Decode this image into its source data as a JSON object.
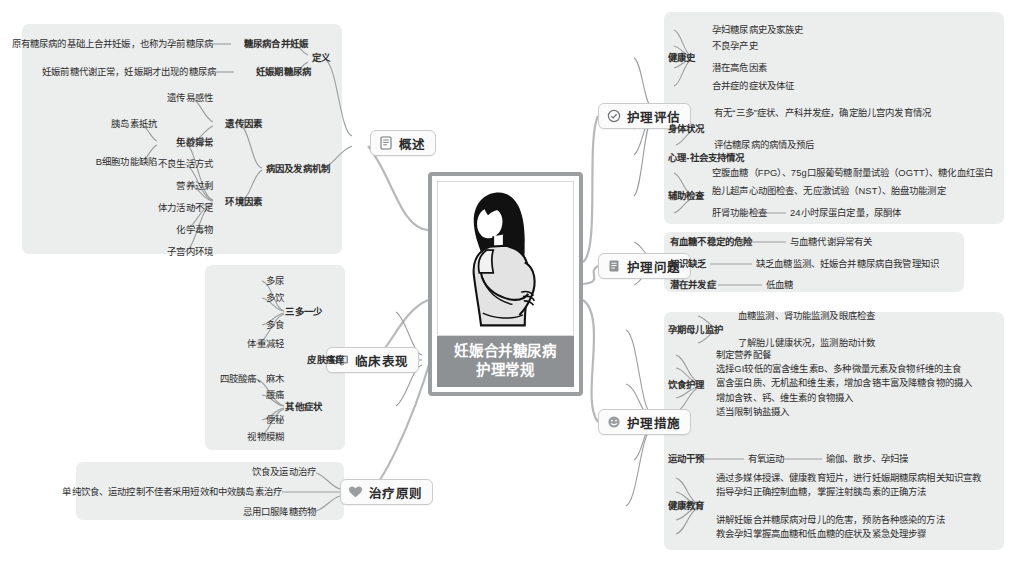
{
  "center": {
    "title_line1": "妊娠合并糖尿病",
    "title_line2": "护理常规",
    "illustration": "pregnant-woman-illustration",
    "frame_color": "#9c9fa2",
    "caption_bg": "#8e9194"
  },
  "branches": [
    {
      "id": "overview",
      "label": "概述",
      "icon": "book-icon"
    },
    {
      "id": "clinical",
      "label": "临床表现",
      "icon": "monitor-icon"
    },
    {
      "id": "treatment",
      "label": "治疗原则",
      "icon": "heart-icon"
    },
    {
      "id": "assessment",
      "label": "护理评估",
      "icon": "check-circle-icon"
    },
    {
      "id": "problems",
      "label": "护理问题",
      "icon": "list-icon"
    },
    {
      "id": "measures",
      "label": "护理措施",
      "icon": "smiley-icon"
    }
  ],
  "overview": {
    "definition": {
      "label": "定义",
      "items": [
        {
          "label": "糖尿病合并妊娠",
          "detail": "原有糖尿病的基础上合并妊娠，也称为孕前糖尿病"
        },
        {
          "label": "妊娠期糖尿病",
          "detail": "妊娠前糖代谢正常，妊娠期才出现的糖尿病"
        }
      ]
    },
    "etiology": {
      "label": "病因及发病机制",
      "genetic": {
        "label": "遗传因素",
        "items": [
          "遗传易感性",
          "免疫异常"
        ],
        "immune_children": [
          "胰岛素抵抗",
          "B细胞功能缺陷"
        ]
      },
      "environment": {
        "label": "环境因素",
        "items": [
          "年龄增长",
          "不良生活方式",
          "营养过剩",
          "体力活动不足",
          "化学毒物",
          "子宫内环境"
        ]
      }
    }
  },
  "clinical": {
    "groups": [
      {
        "label": "三多一少",
        "items": [
          "多尿",
          "多饮",
          "多食",
          "体重减轻"
        ]
      },
      {
        "label": "皮肤瘙痒",
        "items": []
      },
      {
        "label": "其他症状",
        "items": [
          "四肢酸痛、麻木",
          "腰痛",
          "便秘",
          "视物模糊"
        ]
      }
    ]
  },
  "treatment": {
    "items": [
      "饮食及运动治疗",
      "单纯饮食、运动控制不佳者采用短效和中效胰岛素治疗",
      "忌用口服降糖药物"
    ]
  },
  "assessment": {
    "groups": [
      {
        "label": "健康史",
        "items": [
          "孕妇糖尿病史及家族史",
          "不良孕产史",
          "潜在高危因素",
          "合并症的症状及体征"
        ]
      },
      {
        "label": "身体状况",
        "items": [
          "有无“三多”症状、产科并发症，确定胎儿宫内发育情况",
          "评估糖尿病的病情及预后"
        ]
      },
      {
        "label": "心理-社会支持情况",
        "items": []
      },
      {
        "label": "辅助检查",
        "items": [
          "空腹血糖（FPG）、75g口服葡萄糖耐量试验（OGTT）、糖化血红蛋白",
          "胎儿超声心动图检查、无应激试验（NST）、胎盘功能测定",
          "肝肾功能检查"
        ],
        "sub": {
          "parent": "肝肾功能检查",
          "detail": "24小时尿蛋白定量，尿酮体"
        }
      }
    ]
  },
  "problems": {
    "items": [
      {
        "label": "有血糖不稳定的危险",
        "detail": "与血糖代谢异常有关"
      },
      {
        "label": "知识缺乏",
        "detail": "缺乏血糖监测、妊娠合并糖尿病自我管理知识"
      },
      {
        "label": "潜在并发症",
        "detail": "低血糖"
      }
    ]
  },
  "measures": {
    "groups": [
      {
        "label": "孕期母儿监护",
        "items": [
          "血糖监测、肾功能监测及眼底检查",
          "了解胎儿健康状况，监测胎动计数"
        ]
      },
      {
        "label": "饮食护理",
        "items": [
          "制定营养配餐",
          "选择GI较低的富含维生素B、多种微量元素及食物纤维的主食",
          "富含蛋白质、无机盐和维生素，增加含铬丰富及降糖食物的摄入",
          "增加含铁、钙、维生素的食物摄入",
          "适当限制钠盐摄入"
        ]
      },
      {
        "label": "运动干预",
        "items": [
          "有氧运动"
        ],
        "chain": "瑜伽、散步、孕妇操"
      },
      {
        "label": "健康教育",
        "items": [
          "通过多媒体授课、健康教育短片，进行妊娠期糖尿病相关知识宣教",
          "指导孕妇正确控制血糖，掌握注射胰岛素的正确方法",
          "讲解妊娠合并糖尿病对母儿的危害，预防各种感染的方法",
          "教会孕妇掌握高血糖和低血糖的症状及紧急处理步骤"
        ]
      }
    ]
  }
}
